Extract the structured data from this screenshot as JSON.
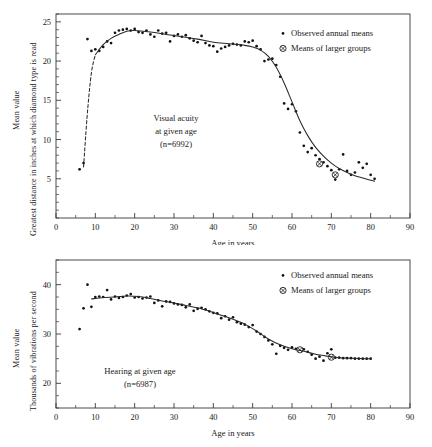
{
  "figure": {
    "panels": [
      {
        "id": "acuity",
        "annotation_lines": [
          "Visual acuity",
          "at given age",
          "(n=6992)"
        ],
        "legend": [
          {
            "symbol": "small-dot",
            "label": "Observed annual means"
          },
          {
            "symbol": "crossed-circle",
            "label": "Means of larger groups"
          }
        ],
        "ylabel_outer": "Mean value",
        "ylabel_inner": "Greatest distance in inches at which diamond type is read",
        "xlabel": "Age in years"
      },
      {
        "id": "hearing",
        "annotation_lines": [
          "Hearing at given age",
          "(n=6987)"
        ],
        "legend": [
          {
            "symbol": "small-dot",
            "label": "Observed annual means"
          },
          {
            "symbol": "crossed-circle",
            "label": "Means of larger groups"
          }
        ],
        "ylabel_outer": "Mean value",
        "ylabel_inner": "Thousands of vibrations per second",
        "xlabel": "Age in years"
      }
    ]
  },
  "chart_data": [
    {
      "type": "scatter",
      "id": "acuity",
      "title": "Visual acuity at given age",
      "subtitle": "(n=6992)",
      "n": 6992,
      "xlabel": "Age in years",
      "ylabel": "Greatest distance in inches at which diamond type is read",
      "ylabel_prefix": "Mean value",
      "xlim": [
        0,
        90
      ],
      "ylim": [
        0,
        26
      ],
      "xticks": [
        0,
        10,
        20,
        30,
        40,
        50,
        60,
        70,
        80,
        90
      ],
      "yticks": [
        5,
        10,
        15,
        20,
        25
      ],
      "xtick_minor_step": 5,
      "ytick_minor_step": 1,
      "grid": false,
      "legend_position": "top-right",
      "series": [
        {
          "name": "Observed annual means",
          "marker": "small-dot",
          "x": [
            6,
            7,
            8,
            9,
            10,
            11,
            12,
            13,
            14,
            15,
            16,
            17,
            18,
            19,
            20,
            21,
            22,
            23,
            24,
            25,
            26,
            27,
            28,
            29,
            30,
            31,
            32,
            33,
            34,
            35,
            36,
            37,
            38,
            39,
            40,
            41,
            42,
            43,
            44,
            45,
            46,
            47,
            48,
            49,
            50,
            51,
            52,
            53,
            54,
            55,
            56,
            57,
            58,
            59,
            60,
            61,
            62,
            63,
            64,
            65,
            66,
            67,
            68,
            69,
            70,
            71,
            72,
            73,
            74,
            75,
            76,
            77,
            78,
            79,
            80,
            81
          ],
          "y": [
            6.2,
            7.0,
            22.8,
            21.3,
            21.5,
            21.3,
            21.8,
            22.5,
            22.3,
            23.6,
            23.9,
            24.0,
            24.1,
            23.9,
            24.1,
            23.7,
            23.6,
            23.9,
            23.4,
            23.1,
            23.9,
            23.5,
            23.6,
            22.5,
            23.2,
            23.4,
            23.1,
            23.3,
            22.9,
            22.6,
            22.4,
            23.2,
            22.3,
            22.0,
            21.9,
            21.2,
            21.6,
            21.8,
            22.0,
            22.2,
            22.1,
            22.0,
            22.5,
            22.4,
            22.6,
            21.9,
            21.5,
            20.0,
            20.2,
            20.3,
            19.5,
            18.0,
            14.6,
            13.9,
            14.5,
            13.6,
            10.9,
            9.2,
            8.4,
            8.9,
            8.0,
            7.5,
            7.1,
            6.6,
            6.1,
            4.9,
            6.2,
            8.1,
            6.0,
            5.5,
            5.8,
            7.1,
            6.4,
            6.9,
            5.5,
            5.0
          ],
          "notes": "dense scatter of annual mean values; low first two points at ages 6-7"
        },
        {
          "name": "Means of larger groups",
          "marker": "crossed-circle",
          "x": [
            67,
            71
          ],
          "y": [
            6.9,
            5.5
          ]
        },
        {
          "name": "Fitted curve",
          "marker": "line",
          "style": "solid-with-dashed-lead",
          "x": [
            7,
            8,
            9,
            10,
            12,
            14,
            16,
            18,
            20,
            24,
            28,
            32,
            36,
            40,
            44,
            48,
            50,
            52,
            54,
            56,
            58,
            60,
            62,
            64,
            66,
            68,
            70,
            72,
            74,
            76,
            78,
            80,
            81
          ],
          "y": [
            6.5,
            13.5,
            18.5,
            20.8,
            22.1,
            22.9,
            23.4,
            23.8,
            23.9,
            23.7,
            23.4,
            23.1,
            22.8,
            22.4,
            22.2,
            22.0,
            21.8,
            21.4,
            20.6,
            19.2,
            17.2,
            14.8,
            12.4,
            10.5,
            9.0,
            7.9,
            7.0,
            6.3,
            5.8,
            5.4,
            5.1,
            4.8,
            4.7
          ]
        }
      ]
    },
    {
      "type": "scatter",
      "id": "hearing",
      "title": "Hearing at given age",
      "subtitle": "(n=6987)",
      "n": 6987,
      "xlabel": "Age in years",
      "ylabel": "Thousands of vibrations per second",
      "ylabel_prefix": "Mean value",
      "xlim": [
        0,
        90
      ],
      "ylim": [
        15,
        45
      ],
      "xticks": [
        0,
        10,
        20,
        30,
        40,
        50,
        60,
        70,
        80,
        90
      ],
      "yticks": [
        20,
        30,
        40
      ],
      "xtick_minor_step": 5,
      "ytick_minor_step": 2.5,
      "grid": false,
      "legend_position": "top-right",
      "series": [
        {
          "name": "Observed annual means",
          "marker": "small-dot",
          "x": [
            6,
            7,
            8,
            9,
            10,
            11,
            12,
            13,
            14,
            15,
            16,
            17,
            18,
            19,
            20,
            21,
            22,
            23,
            24,
            25,
            26,
            27,
            28,
            29,
            30,
            31,
            32,
            33,
            34,
            35,
            36,
            37,
            38,
            39,
            40,
            41,
            42,
            43,
            44,
            45,
            46,
            47,
            48,
            49,
            50,
            51,
            52,
            53,
            54,
            55,
            56,
            57,
            58,
            59,
            60,
            61,
            62,
            63,
            64,
            65,
            66,
            67,
            68,
            69,
            70,
            71,
            72,
            73,
            74,
            75,
            76,
            77,
            78,
            79,
            80
          ],
          "y": [
            31.0,
            35.2,
            40.0,
            35.5,
            37.5,
            37.6,
            37.5,
            38.9,
            37.0,
            37.6,
            37.3,
            37.5,
            37.8,
            38.1,
            37.4,
            37.5,
            37.2,
            37.4,
            37.6,
            36.3,
            36.8,
            35.6,
            36.6,
            36.5,
            36.2,
            36.0,
            35.9,
            35.4,
            36.0,
            34.7,
            35.1,
            35.3,
            35.0,
            34.6,
            34.3,
            34.2,
            33.2,
            33.6,
            32.9,
            33.4,
            32.4,
            32.1,
            31.9,
            31.4,
            31.8,
            30.5,
            30.0,
            29.4,
            28.7,
            27.9,
            26.0,
            27.6,
            27.2,
            26.8,
            27.3,
            27.0,
            26.6,
            26.9,
            26.4,
            25.8,
            25.0,
            25.4,
            24.6,
            26.1,
            26.9,
            25.2,
            25.2,
            25.1,
            25.1,
            25.1,
            25.0,
            25.0,
            25.0,
            25.0,
            25.0
          ],
          "notes": "gradual decline from ~37.5 at age 10 to ~25 at age 80"
        },
        {
          "name": "Means of larger groups",
          "marker": "crossed-circle",
          "x": [
            62,
            70
          ],
          "y": [
            26.8,
            25.3
          ]
        },
        {
          "name": "Fitted curve",
          "marker": "line",
          "style": "solid",
          "x": [
            9,
            12,
            15,
            18,
            21,
            24,
            27,
            30,
            33,
            36,
            39,
            42,
            45,
            48,
            51,
            54,
            57,
            60,
            63,
            66,
            69,
            72,
            75,
            78,
            80
          ],
          "y": [
            37.1,
            37.4,
            37.5,
            37.7,
            37.6,
            37.2,
            36.7,
            36.3,
            35.8,
            35.3,
            34.6,
            33.8,
            33.0,
            32.0,
            30.6,
            29.0,
            27.8,
            27.0,
            26.5,
            25.9,
            25.5,
            25.2,
            25.1,
            25.0,
            25.0
          ]
        }
      ]
    }
  ]
}
